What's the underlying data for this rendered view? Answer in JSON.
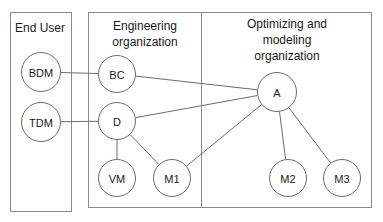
{
  "diagram": {
    "title_end_user": "End User",
    "title_engineering_line1": "Engineering",
    "title_engineering_line2": "organization",
    "title_optimizing_line1": "Optimizing and",
    "title_optimizing_line2": "modeling",
    "title_optimizing_line3": "organization",
    "colors": {
      "panel_border": "#8a8a8a",
      "node_stroke": "#6b6b6b",
      "edge_stroke": "#6b6b6b",
      "text": "#1a1a1a",
      "background": "#ffffff"
    },
    "panels": [
      {
        "id": "end-user",
        "label": "End User",
        "x": 10,
        "y": 12,
        "width": 62,
        "height": 200
      },
      {
        "id": "engineering",
        "label": "Engineering organization",
        "x": 88,
        "y": 12,
        "width": 113,
        "height": 196
      },
      {
        "id": "optimizing",
        "label": "Optimizing and modeling organization",
        "x": 201,
        "y": 12,
        "width": 171,
        "height": 196
      }
    ],
    "nodes": [
      {
        "id": "BDM",
        "label": "BDM",
        "cx": 41,
        "cy": 72,
        "r": 20,
        "panel": "end-user"
      },
      {
        "id": "TDM",
        "label": "TDM",
        "cx": 41,
        "cy": 122,
        "r": 20,
        "panel": "end-user"
      },
      {
        "id": "BC",
        "label": "BC",
        "cx": 117,
        "cy": 74,
        "r": 19,
        "panel": "engineering"
      },
      {
        "id": "D",
        "label": "D",
        "cx": 117,
        "cy": 121,
        "r": 19,
        "panel": "engineering"
      },
      {
        "id": "VM",
        "label": "VM",
        "cx": 117,
        "cy": 178,
        "r": 19,
        "panel": "engineering"
      },
      {
        "id": "M1",
        "label": "M1",
        "cx": 172,
        "cy": 178,
        "r": 19,
        "panel": "engineering"
      },
      {
        "id": "A",
        "label": "A",
        "cx": 277,
        "cy": 92,
        "r": 20,
        "panel": "optimizing"
      },
      {
        "id": "M2",
        "label": "M2",
        "cx": 288,
        "cy": 178,
        "r": 19,
        "panel": "optimizing"
      },
      {
        "id": "M3",
        "label": "M3",
        "cx": 342,
        "cy": 178,
        "r": 19,
        "panel": "optimizing"
      }
    ],
    "edges": [
      {
        "id": "bdm-bc",
        "from": "BDM",
        "to": "BC"
      },
      {
        "id": "tdm-d",
        "from": "TDM",
        "to": "D"
      },
      {
        "id": "bc-a",
        "from": "BC",
        "to": "A"
      },
      {
        "id": "d-a",
        "from": "D",
        "to": "A"
      },
      {
        "id": "d-vm",
        "from": "D",
        "to": "VM"
      },
      {
        "id": "d-m1",
        "from": "D",
        "to": "M1"
      },
      {
        "id": "m1-a",
        "from": "M1",
        "to": "A"
      },
      {
        "id": "a-m2",
        "from": "A",
        "to": "M2"
      },
      {
        "id": "a-m3",
        "from": "A",
        "to": "M3"
      }
    ]
  }
}
